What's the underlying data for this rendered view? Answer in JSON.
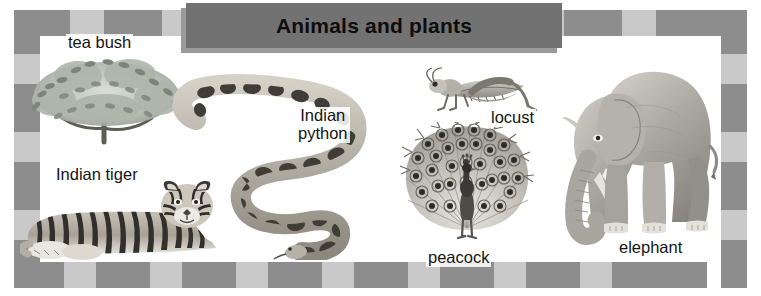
{
  "poster": {
    "title": "Animals and plants",
    "width": 761,
    "height": 296,
    "background_color": "#ffffff"
  },
  "banner": {
    "label": "Animals and plants",
    "fill_color": "#727272",
    "shadow_color": "#9a9a9a",
    "text_color": "#0d0d0d"
  },
  "frame": {
    "style": "checkered",
    "tile_colors": [
      "#8d8d8d",
      "#c9c9c9"
    ],
    "top_tiles": [
      {
        "color": "#8d8d8d",
        "size": 56
      },
      {
        "color": "#c9c9c9",
        "size": 34
      },
      {
        "color": "#8d8d8d",
        "size": 58
      },
      {
        "color": "#c9c9c9",
        "size": 34
      },
      {
        "color": "#8d8d8d",
        "size": 58
      },
      {
        "color": "#c9c9c9",
        "size": 34
      },
      {
        "color": "#8d8d8d",
        "size": 58
      },
      {
        "color": "#c9c9c9",
        "size": 34
      },
      {
        "color": "#8d8d8d",
        "size": 58
      },
      {
        "color": "#c9c9c9",
        "size": 34
      },
      {
        "color": "#8d8d8d",
        "size": 58
      },
      {
        "color": "#c9c9c9",
        "size": 34
      },
      {
        "color": "#8d8d8d",
        "size": 58
      },
      {
        "color": "#c9c9c9",
        "size": 34
      },
      {
        "color": "#8d8d8d",
        "size": 95
      }
    ],
    "bottom_tiles": [
      {
        "color": "#8d8d8d",
        "size": 50
      },
      {
        "color": "#c9c9c9",
        "size": 32
      },
      {
        "color": "#8d8d8d",
        "size": 54
      },
      {
        "color": "#c9c9c9",
        "size": 32
      },
      {
        "color": "#8d8d8d",
        "size": 54
      },
      {
        "color": "#c9c9c9",
        "size": 32
      },
      {
        "color": "#8d8d8d",
        "size": 54
      },
      {
        "color": "#c9c9c9",
        "size": 32
      },
      {
        "color": "#8d8d8d",
        "size": 54
      },
      {
        "color": "#c9c9c9",
        "size": 32
      },
      {
        "color": "#8d8d8d",
        "size": 54
      },
      {
        "color": "#c9c9c9",
        "size": 32
      },
      {
        "color": "#8d8d8d",
        "size": 54
      },
      {
        "color": "#c9c9c9",
        "size": 32
      },
      {
        "color": "#8d8d8d",
        "size": 95
      }
    ],
    "left_tiles": [
      {
        "color": "#8d8d8d",
        "size": 44
      },
      {
        "color": "#c9c9c9",
        "size": 30
      },
      {
        "color": "#8d8d8d",
        "size": 48
      },
      {
        "color": "#c9c9c9",
        "size": 30
      },
      {
        "color": "#8d8d8d",
        "size": 48
      },
      {
        "color": "#c9c9c9",
        "size": 30
      },
      {
        "color": "#8d8d8d",
        "size": 48
      }
    ],
    "right_tiles": [
      {
        "color": "#8d8d8d",
        "size": 44
      },
      {
        "color": "#c9c9c9",
        "size": 30
      },
      {
        "color": "#8d8d8d",
        "size": 48
      },
      {
        "color": "#c9c9c9",
        "size": 30
      },
      {
        "color": "#8d8d8d",
        "size": 48
      },
      {
        "color": "#c9c9c9",
        "size": 30
      },
      {
        "color": "#8d8d8d",
        "size": 48
      }
    ]
  },
  "items": [
    {
      "id": "tea-bush",
      "label": "tea bush",
      "kind": "plant"
    },
    {
      "id": "indian-tiger",
      "label": "Indian tiger",
      "kind": "animal"
    },
    {
      "id": "indian-python",
      "label": "Indian\npython",
      "kind": "animal"
    },
    {
      "id": "locust",
      "label": "locust",
      "kind": "animal"
    },
    {
      "id": "peacock",
      "label": "peacock",
      "kind": "animal"
    },
    {
      "id": "elephant",
      "label": "elephant",
      "kind": "animal"
    }
  ]
}
